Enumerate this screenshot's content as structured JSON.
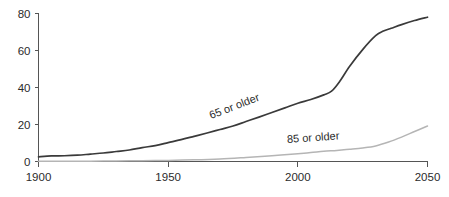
{
  "chart_data": {
    "type": "line",
    "title": "",
    "subtitle": "",
    "xlabel": "",
    "ylabel": "",
    "xlim": [
      1900,
      2050
    ],
    "ylim": [
      0,
      80
    ],
    "xticks": [
      1900,
      1950,
      2000,
      2050
    ],
    "xtick_labels": [
      "1900",
      "1950",
      "2000",
      "2050"
    ],
    "yticks": [
      0,
      20,
      40,
      60,
      80
    ],
    "ytick_labels": [
      "0",
      "20",
      "40",
      "60",
      "80"
    ],
    "grid": false,
    "legend_position": "inline-annotations",
    "series": [
      {
        "name": "65 or older",
        "color": "#3a3a3a",
        "label_annotation": "65 or older",
        "x": [
          1900,
          1905,
          1910,
          1915,
          1920,
          1925,
          1930,
          1935,
          1940,
          1945,
          1950,
          1955,
          1960,
          1965,
          1970,
          1975,
          1980,
          1985,
          1990,
          1995,
          2000,
          2005,
          2010,
          2013,
          2016,
          2020,
          2025,
          2030,
          2033,
          2036,
          2040,
          2045,
          2050
        ],
        "values": [
          2.5,
          3.0,
          3.1,
          3.4,
          4.0,
          4.6,
          5.4,
          6.2,
          7.5,
          8.6,
          10.2,
          11.8,
          13.6,
          15.4,
          17.3,
          19.2,
          21.6,
          24.0,
          26.5,
          29.0,
          31.5,
          33.5,
          36.0,
          38.0,
          43.0,
          51.5,
          60.5,
          68.0,
          70.5,
          72.0,
          74.0,
          76.2,
          78.0
        ]
      },
      {
        "name": "85 or older",
        "color": "#b5b5b5",
        "label_annotation": "85 or older",
        "x": [
          1900,
          1910,
          1920,
          1930,
          1940,
          1950,
          1960,
          1970,
          1980,
          1990,
          2000,
          2005,
          2010,
          2015,
          2020,
          2025,
          2030,
          2035,
          2040,
          2045,
          2050
        ],
        "values": [
          0.1,
          0.2,
          0.2,
          0.3,
          0.4,
          0.6,
          0.9,
          1.4,
          2.2,
          3.1,
          4.2,
          4.8,
          5.5,
          6.0,
          6.6,
          7.3,
          8.4,
          10.5,
          13.2,
          16.2,
          19.2
        ]
      }
    ],
    "annotations": [
      {
        "text": "65 or older",
        "series": "65 or older",
        "rotation_deg": -21,
        "x_data": 1976,
        "y_data": 28
      },
      {
        "text": "85 or older",
        "series": "85 or older",
        "rotation_deg": -4,
        "x_data": 2006,
        "y_data": 11
      }
    ]
  },
  "axes": {
    "y_axis_name": "y-axis",
    "x_axis_name": "x-axis"
  }
}
